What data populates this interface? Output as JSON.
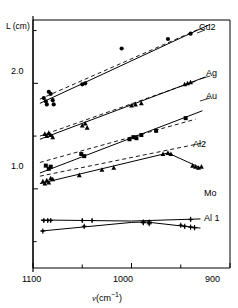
{
  "figure": {
    "ylabel": "L (cm)",
    "xlabel_symbol": "ν",
    "xlabel_unit": "(cm",
    "xlabel_exp": "−1",
    "xlabel_close": ")",
    "y_ticklabels": [
      "2.0",
      "1.0"
    ],
    "x_ticklabels": [
      "1100",
      "1000",
      "900"
    ],
    "line_color": "#000000",
    "marker_color": "#000000",
    "background": "#ffffff"
  },
  "series_labels": {
    "cu2": "Cu2",
    "ag": "Ag",
    "au": "Au",
    "al2": "Al2",
    "mo": "Mo",
    "al1": "Al 1"
  },
  "chart_data": {
    "type": "scatter",
    "title": "",
    "xlabel": "ν (cm−1)",
    "ylabel": "L (cm)",
    "xlim": [
      1100,
      900
    ],
    "ylim": [
      0.25,
      2.6
    ],
    "x_ticks": [
      1100,
      1050,
      1000,
      950,
      900
    ],
    "x_ticklabels": [
      "1100",
      "",
      "1000",
      "",
      "900"
    ],
    "y_ticks": [
      0.5,
      1.0,
      1.5,
      2.0,
      2.5
    ],
    "y_ticklabels": [
      "",
      "1.0",
      "",
      "2.0",
      ""
    ],
    "grid": false,
    "x_axis_reversed": true,
    "legend": "inline-right-labels",
    "series": [
      {
        "name": "Cu2",
        "label": "Cu2",
        "marker": "filled-circle",
        "fit": "solid-line",
        "reference": "dashed-line",
        "points": [
          {
            "x": 1089,
            "y": 1.86
          },
          {
            "x": 1087,
            "y": 1.83
          },
          {
            "x": 1086,
            "y": 1.8
          },
          {
            "x": 1084,
            "y": 1.92
          },
          {
            "x": 1082,
            "y": 1.9
          },
          {
            "x": 1080,
            "y": 1.84
          },
          {
            "x": 1079,
            "y": 1.8
          },
          {
            "x": 1050,
            "y": 1.99
          },
          {
            "x": 1047,
            "y": 2.0
          },
          {
            "x": 1010,
            "y": 2.33
          },
          {
            "x": 963,
            "y": 2.42
          },
          {
            "x": 940,
            "y": 2.47
          }
        ],
        "fit_line": [
          {
            "x": 1093,
            "y": 1.81
          },
          {
            "x": 920,
            "y": 2.56
          }
        ],
        "dashed_line": [
          {
            "x": 1093,
            "y": 1.85
          },
          {
            "x": 930,
            "y": 2.52
          }
        ]
      },
      {
        "name": "Ag",
        "label": "Ag",
        "marker": "filled-triangle",
        "fit": "solid-line",
        "reference": "dashed-line",
        "points": [
          {
            "x": 1088,
            "y": 1.52
          },
          {
            "x": 1086,
            "y": 1.5
          },
          {
            "x": 1084,
            "y": 1.53
          },
          {
            "x": 1082,
            "y": 1.51
          },
          {
            "x": 1080,
            "y": 1.49
          },
          {
            "x": 1050,
            "y": 1.6
          },
          {
            "x": 1047,
            "y": 1.62
          },
          {
            "x": 1045,
            "y": 1.58
          },
          {
            "x": 1000,
            "y": 1.79
          },
          {
            "x": 996,
            "y": 1.8
          },
          {
            "x": 990,
            "y": 1.81
          },
          {
            "x": 946,
            "y": 1.99
          },
          {
            "x": 943,
            "y": 2.0
          },
          {
            "x": 940,
            "y": 2.01
          }
        ],
        "fit_line": [
          {
            "x": 1093,
            "y": 1.47
          },
          {
            "x": 925,
            "y": 2.06
          }
        ],
        "dashed_line": [
          {
            "x": 1093,
            "y": 1.5
          },
          {
            "x": 935,
            "y": 2.02
          }
        ]
      },
      {
        "name": "Au",
        "label": "Au",
        "marker": "filled-square",
        "fit": "solid-line",
        "reference": "dashed-line",
        "points": [
          {
            "x": 1087,
            "y": 1.22
          },
          {
            "x": 1084,
            "y": 1.19
          },
          {
            "x": 1082,
            "y": 1.21
          },
          {
            "x": 1051,
            "y": 1.33
          },
          {
            "x": 1048,
            "y": 1.31
          },
          {
            "x": 1002,
            "y": 1.47
          },
          {
            "x": 998,
            "y": 1.49
          },
          {
            "x": 995,
            "y": 1.48
          },
          {
            "x": 990,
            "y": 1.51
          },
          {
            "x": 975,
            "y": 1.55
          },
          {
            "x": 945,
            "y": 1.67
          }
        ],
        "fit_line": [
          {
            "x": 1093,
            "y": 1.15
          },
          {
            "x": 928,
            "y": 1.74
          }
        ],
        "dashed_line": [
          {
            "x": 1093,
            "y": 1.25
          },
          {
            "x": 935,
            "y": 1.66
          }
        ]
      },
      {
        "name": "Al2",
        "label": "Al2",
        "marker": "filled-triangle",
        "fit": "solid-line-with-break",
        "reference": "dashed-line",
        "points": [
          {
            "x": 1090,
            "y": 1.07
          },
          {
            "x": 1088,
            "y": 1.05
          },
          {
            "x": 1086,
            "y": 1.08
          },
          {
            "x": 1084,
            "y": 1.06
          },
          {
            "x": 1082,
            "y": 1.1
          },
          {
            "x": 1080,
            "y": 1.09
          },
          {
            "x": 1053,
            "y": 1.13
          },
          {
            "x": 1030,
            "y": 1.18
          },
          {
            "x": 1018,
            "y": 1.2
          },
          {
            "x": 968,
            "y": 1.33
          },
          {
            "x": 963,
            "y": 1.34
          },
          {
            "x": 960,
            "y": 1.33
          },
          {
            "x": 938,
            "y": 1.22
          },
          {
            "x": 935,
            "y": 1.21
          },
          {
            "x": 932,
            "y": 1.2
          },
          {
            "x": 929,
            "y": 1.21
          }
        ],
        "fit_line": [
          {
            "x": 1093,
            "y": 1.05
          },
          {
            "x": 963,
            "y": 1.34
          },
          {
            "x": 930,
            "y": 1.2
          }
        ],
        "dashed_line": [
          {
            "x": 1093,
            "y": 1.12
          },
          {
            "x": 925,
            "y": 1.44
          }
        ]
      },
      {
        "name": "Mo",
        "label": "Mo",
        "marker": "plus-filled",
        "fit": "solid-line",
        "reference": "none",
        "points": [
          {
            "x": 1089,
            "y": 0.7
          },
          {
            "x": 1085,
            "y": 0.7
          },
          {
            "x": 1082,
            "y": 0.7
          },
          {
            "x": 1050,
            "y": 0.7
          },
          {
            "x": 1040,
            "y": 0.7
          },
          {
            "x": 988,
            "y": 0.68
          },
          {
            "x": 982,
            "y": 0.67
          },
          {
            "x": 940,
            "y": 0.71
          }
        ],
        "fit_line": [
          {
            "x": 1092,
            "y": 0.705
          },
          {
            "x": 1000,
            "y": 0.695
          },
          {
            "x": 930,
            "y": 0.715
          }
        ]
      },
      {
        "name": "Al 1",
        "label": "Al 1",
        "marker": "plus-filled",
        "fit": "solid-line",
        "reference": "none",
        "points": [
          {
            "x": 1090,
            "y": 0.6
          },
          {
            "x": 1048,
            "y": 0.645
          },
          {
            "x": 988,
            "y": 0.685
          },
          {
            "x": 982,
            "y": 0.685
          },
          {
            "x": 950,
            "y": 0.655
          },
          {
            "x": 946,
            "y": 0.645
          },
          {
            "x": 940,
            "y": 0.638
          },
          {
            "x": 936,
            "y": 0.632
          }
        ],
        "fit_line": [
          {
            "x": 1092,
            "y": 0.6
          },
          {
            "x": 1000,
            "y": 0.682
          },
          {
            "x": 985,
            "y": 0.686
          },
          {
            "x": 930,
            "y": 0.628
          }
        ]
      }
    ]
  }
}
